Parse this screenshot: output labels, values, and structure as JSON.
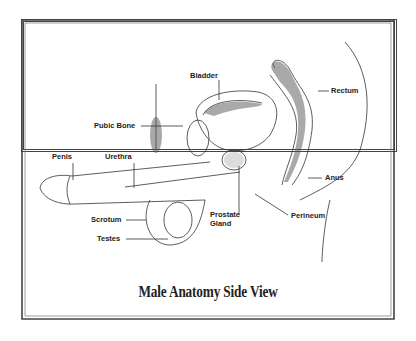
{
  "diagram": {
    "title": "Male Anatomy Side View",
    "labels": {
      "bladder": "Bladder",
      "rectum": "Rectum",
      "pubic_bone": "Pubic Bone",
      "penis": "Penis",
      "urethra": "Urethra",
      "anus": "Anus",
      "scrotum": "Scrotum",
      "prostate_line1": "Prostate",
      "prostate_line2": "Gland",
      "perineum": "Perineum",
      "testes": "Testes"
    },
    "colors": {
      "frame": "#444444",
      "line": "#333333",
      "text": "#222222",
      "background": "#ffffff"
    }
  }
}
